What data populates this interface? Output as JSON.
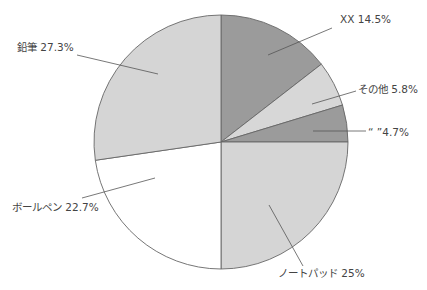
{
  "chart_data": {
    "type": "pie",
    "title": "",
    "start_angle_deg": 0,
    "direction": "clockwise",
    "center": [
      221,
      142
    ],
    "radius": 127,
    "slices": [
      {
        "label": "XX",
        "value": 14.5,
        "display": "XX 14.5%",
        "color": "#9b9b9b",
        "label_pos": [
          340,
          23
        ],
        "anchor": "start",
        "leader": [
          [
            268,
            55
          ],
          [
            332,
            28
          ]
        ]
      },
      {
        "label": "その他",
        "value": 5.8,
        "display": "その他 5.8%",
        "color": "#d7d7d7",
        "label_pos": [
          358,
          93
        ],
        "anchor": "start",
        "leader": [
          [
            312,
            104
          ],
          [
            356,
            91
          ]
        ]
      },
      {
        "label": "“ ”",
        "value": 4.7,
        "display": "“ ”4.7%",
        "color": "#9b9b9b",
        "label_pos": [
          368,
          136
        ],
        "anchor": "start",
        "leader": [
          [
            313,
            131
          ],
          [
            366,
            131
          ]
        ]
      },
      {
        "label": "ノートパッド",
        "value": 25,
        "display": "ノートパッド 25%",
        "color": "#d5d5d5",
        "label_pos": [
          278,
          277
        ],
        "anchor": "start",
        "leader": [
          [
            269,
            205
          ],
          [
            303,
            266
          ]
        ]
      },
      {
        "label": "ボールペン",
        "value": 22.7,
        "display": "ボールペン 22.7%",
        "color": "#ffffff",
        "label_pos": [
          12,
          211
        ],
        "anchor": "start",
        "leader": [
          [
            155,
            178
          ],
          [
            82,
            198
          ]
        ]
      },
      {
        "label": "鉛筆",
        "value": 27.3,
        "display": "鉛筆 27.3%",
        "color": "#d5d5d5",
        "label_pos": [
          17,
          51
        ],
        "anchor": "start",
        "leader": [
          [
            158,
            74
          ],
          [
            77,
            55
          ]
        ]
      }
    ],
    "stroke_color": "#666666",
    "legend": "none"
  }
}
